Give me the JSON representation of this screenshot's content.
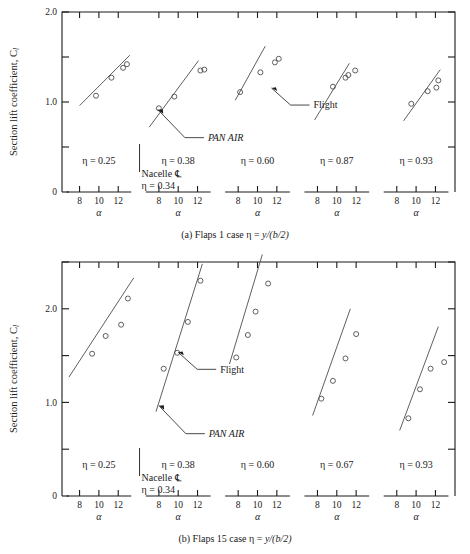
{
  "figure": {
    "ylabel": "Section lift coefficient, C",
    "ylabel_sub": "l",
    "xlabel_symbol": "α",
    "nacelle_label": "Nacelle ℄",
    "annot_flight": "Flight",
    "annot_panair": "PAN AIR",
    "y_ticks_major": [
      "0",
      "1.0",
      "2.0"
    ],
    "x_ticks": [
      "8",
      "10",
      "12"
    ]
  },
  "charts": [
    {
      "id": "a",
      "caption_prefix": "(a) Flaps 1 case ",
      "caption_eta": "η = ",
      "caption_expr": "y/(b/2)",
      "ylim": [
        0,
        2.0
      ],
      "ymajor": [
        0,
        1.0,
        2.0
      ],
      "yminor": [
        0.5,
        1.5
      ],
      "xlim": [
        6.7,
        13.3
      ],
      "xticks": [
        8,
        10,
        12
      ],
      "nacelle_eta_top": "η = 0.34",
      "panels": [
        {
          "eta_label": "η = 0.25",
          "points": [
            [
              9.7,
              1.07
            ],
            [
              11.3,
              1.27
            ],
            [
              12.5,
              1.38
            ],
            [
              12.9,
              1.42
            ]
          ],
          "fit": [
            [
              8.0,
              0.96
            ],
            [
              13.2,
              1.52
            ]
          ]
        },
        {
          "eta_label": "η = 0.38",
          "points": [
            [
              8.0,
              0.93
            ],
            [
              9.6,
              1.06
            ],
            [
              12.3,
              1.35
            ],
            [
              12.7,
              1.36
            ]
          ],
          "fit": [
            [
              7.0,
              0.72
            ],
            [
              12.1,
              1.46
            ]
          ]
        },
        {
          "eta_label": "η = 0.60",
          "points": [
            [
              8.2,
              1.11
            ],
            [
              10.3,
              1.33
            ],
            [
              11.8,
              1.44
            ],
            [
              12.2,
              1.48
            ]
          ],
          "fit": [
            [
              7.7,
              1.02
            ],
            [
              10.8,
              1.62
            ]
          ]
        },
        {
          "eta_label": "η = 0.87",
          "points": [
            [
              9.6,
              1.17
            ],
            [
              10.9,
              1.27
            ],
            [
              11.2,
              1.3
            ],
            [
              11.9,
              1.35
            ]
          ],
          "fit": [
            [
              7.7,
              0.8
            ],
            [
              11.3,
              1.43
            ]
          ]
        },
        {
          "eta_label": "η = 0.93",
          "points": [
            [
              9.5,
              0.98
            ],
            [
              11.2,
              1.12
            ],
            [
              12.1,
              1.16
            ],
            [
              12.3,
              1.24
            ]
          ],
          "fit": [
            [
              8.7,
              0.79
            ],
            [
              12.5,
              1.36
            ]
          ]
        }
      ],
      "annotations": {
        "flight": {
          "label": "Flight",
          "anchor": [
            11.45,
            1.155
          ],
          "panel": 2
        },
        "panair": {
          "label": "PAN AIR",
          "anchor": [
            7.9,
            0.915
          ],
          "panel": 1
        }
      }
    },
    {
      "id": "b",
      "caption_prefix": "(b) Flaps 15 case ",
      "caption_eta": "η = ",
      "caption_expr": "y/(b/2)",
      "ylim": [
        0,
        2.5
      ],
      "ymajor": [
        0,
        1.0,
        2.0
      ],
      "yminor": [
        0.5,
        1.5,
        2.5
      ],
      "xlim": [
        6.7,
        13.3
      ],
      "xticks": [
        8,
        10,
        12
      ],
      "nacelle_eta_top": "η = 0.34",
      "panels": [
        {
          "eta_label": "η = 0.25",
          "points": [
            [
              9.3,
              1.52
            ],
            [
              10.7,
              1.71
            ],
            [
              12.3,
              1.83
            ],
            [
              13.0,
              2.11
            ]
          ],
          "fit": [
            [
              6.9,
              1.27
            ],
            [
              13.6,
              2.33
            ]
          ]
        },
        {
          "eta_label": "η = 0.38",
          "points": [
            [
              8.5,
              1.36
            ],
            [
              9.9,
              1.53
            ],
            [
              11.0,
              1.86
            ],
            [
              12.3,
              2.3
            ]
          ],
          "fit": [
            [
              7.7,
              0.9
            ],
            [
              12.5,
              2.48
            ]
          ]
        },
        {
          "eta_label": "η = 0.60",
          "points": [
            [
              7.8,
              1.48
            ],
            [
              9.0,
              1.72
            ],
            [
              9.8,
              1.97
            ],
            [
              11.1,
              2.27
            ]
          ],
          "fit": [
            [
              7.1,
              1.41
            ],
            [
              10.5,
              2.58
            ]
          ]
        },
        {
          "eta_label": "η = 0.67",
          "points": [
            [
              8.4,
              1.04
            ],
            [
              9.6,
              1.23
            ],
            [
              10.9,
              1.47
            ],
            [
              12.0,
              1.73
            ]
          ],
          "fit": [
            [
              7.5,
              0.86
            ],
            [
              11.4,
              2.0
            ]
          ]
        },
        {
          "eta_label": "η = 0.93",
          "points": [
            [
              9.2,
              0.83
            ],
            [
              10.4,
              1.14
            ],
            [
              11.5,
              1.36
            ],
            [
              12.9,
              1.43
            ]
          ],
          "fit": [
            [
              8.3,
              0.7
            ],
            [
              12.3,
              1.81
            ]
          ]
        }
      ],
      "annotations": {
        "flight": {
          "label": "Flight",
          "anchor": [
            10.0,
            1.535
          ],
          "panel": 1
        },
        "panair": {
          "label": "PAN AIR",
          "anchor": [
            8.0,
            0.965
          ],
          "panel": 1
        }
      }
    }
  ]
}
